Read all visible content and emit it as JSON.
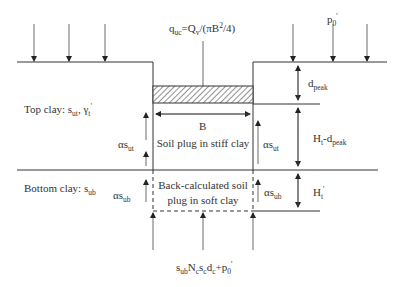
{
  "diagram": {
    "labels": {
      "load": {
        "base": "q",
        "sub": "uc",
        "rest": "=Q",
        "sub2": "v",
        "tail": "/(πB",
        "sup": "2",
        "end": "/4)"
      },
      "surcharge": {
        "base": "p",
        "sub": "0",
        "prime": "'"
      },
      "top_clay": {
        "text": "Top clay: s",
        "sub": "ut",
        "mid": ", γ",
        "sub2": "t",
        "prime": "'"
      },
      "bottom_clay": {
        "text": "Bottom clay: s",
        "sub": "ub"
      },
      "width": "B",
      "plug_stiff": "Soil plug in stiff clay",
      "plug_soft_line1": "Back-calculated soil",
      "plug_soft_line2": "plug in soft clay",
      "shear_top_left": {
        "base": "αs",
        "sub": "ut"
      },
      "shear_top_right": {
        "base": "αs",
        "sub": "ut"
      },
      "shear_bottom_left": {
        "base": "αs",
        "sub": "ub"
      },
      "shear_bottom_right": {
        "base": "αs",
        "sub": "ub"
      },
      "d_peak": {
        "base": "d",
        "sub": "peak"
      },
      "ht_minus_dpeak": {
        "base": "H",
        "sub": "t",
        "mid": "-d",
        "sub2": "peak"
      },
      "ht_prime": {
        "base": "H",
        "sub": "t",
        "prime": "'"
      },
      "base_resistance": {
        "a": "s",
        "a_sub": "ub",
        "b": "N",
        "b_sub": "c",
        "c": "s",
        "c_sub": "c",
        "d": "d",
        "d_sub": "c",
        "e": "+p",
        "e_sub": "0",
        "prime": "'"
      }
    }
  }
}
